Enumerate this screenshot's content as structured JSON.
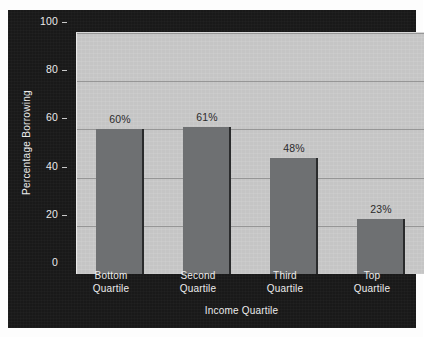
{
  "chart_data": {
    "type": "bar",
    "title": "",
    "subtitle": "",
    "xlabel": "Income Quartile",
    "ylabel": "Percentage Borrowing",
    "categories": [
      "Bottom Quartile",
      "Second Quartile",
      "Third Quartile",
      "Top Quartile"
    ],
    "category_lines": [
      [
        "Bottom",
        "Quartile"
      ],
      [
        "Second",
        "Quartile"
      ],
      [
        "Third",
        "Quartile"
      ],
      [
        "Top",
        "Quartile"
      ]
    ],
    "values": [
      60,
      61,
      48,
      23
    ],
    "data_labels": [
      "60%",
      "61%",
      "48%",
      "23%"
    ],
    "ylim": [
      0,
      100
    ],
    "yticks": [
      0,
      20,
      40,
      60,
      80,
      100
    ],
    "ytick_labels": [
      "0",
      "20",
      "40",
      "60",
      "80",
      "100"
    ],
    "grid": true,
    "grid_axis": "y",
    "legend": false,
    "legend_position": "none",
    "colors": {
      "bar": "#6e7072",
      "bar_edge": "#2a2b2c",
      "plot_background": "#c9c9c9",
      "panel_background": "#191919",
      "gridline": "#8d8d8d",
      "axis_text": "#ececec",
      "data_label_text": "#2b2b2b",
      "figure_background": "#fdfdfd"
    }
  }
}
